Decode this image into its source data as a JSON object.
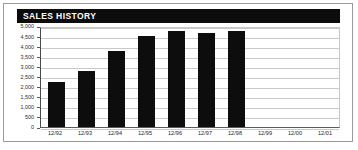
{
  "title": "SALES HISTORY",
  "colors": {
    "bar": "#0d0d0d",
    "title_bar_background": "#0c0c0c",
    "title_text": "#ffffff",
    "gridline": "#c9c9c9",
    "border": "#9a9a9a",
    "axis": "#4a4a4a"
  },
  "chart_data": {
    "type": "bar",
    "title": "SALES HISTORY",
    "xlabel": "",
    "ylabel": "",
    "categories": [
      "12/92",
      "12/93",
      "12/94",
      "12/95",
      "12/96",
      "12/97",
      "12/98",
      "12/99",
      "12/00",
      "12/01"
    ],
    "values": [
      2250,
      2750,
      3750,
      4500,
      4750,
      4650,
      4750,
      null,
      null,
      null
    ],
    "ylim": [
      0,
      5000
    ],
    "yticks": [
      0,
      500,
      1000,
      1500,
      2000,
      2500,
      3000,
      3500,
      4000,
      4500,
      5000
    ],
    "ytick_labels": [
      "0",
      "500",
      "1,000",
      "1,500",
      "2,000",
      "2,500",
      "3,000",
      "3,500",
      "4,000",
      "4,500",
      "5,000"
    ],
    "grid": true,
    "legend": false,
    "legend_position": "none",
    "series": [
      {
        "name": "Sales",
        "values": [
          2250,
          2750,
          3750,
          4500,
          4750,
          4650,
          4750,
          null,
          null,
          null
        ]
      }
    ]
  }
}
